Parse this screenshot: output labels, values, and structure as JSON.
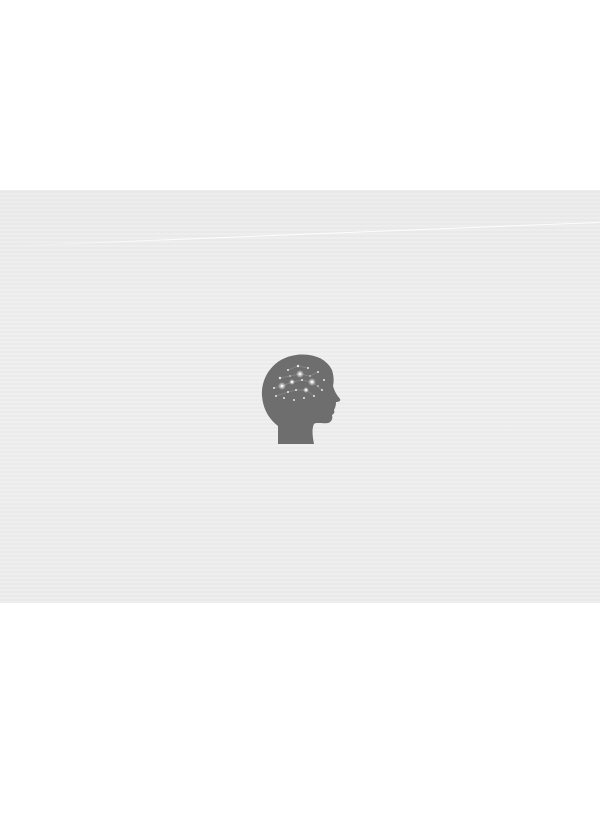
{
  "scene": {
    "background_color": "#ffffff",
    "band_color": "#ededed",
    "figure": {
      "icon": "head-brain-network-icon",
      "silhouette_color": "#6e6e6e",
      "glow_color": "#ffffff"
    }
  }
}
